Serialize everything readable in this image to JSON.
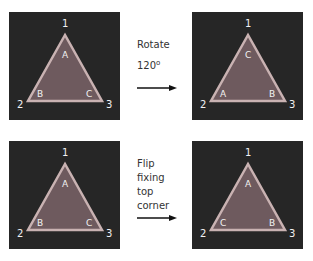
{
  "colors": {
    "panel_bg": "#262626",
    "tri_fill": "#6e5a5e",
    "tri_stroke": "#c9b2b2",
    "label": "#f2f2f2"
  },
  "vertex_labels": [
    "1",
    "2",
    "3"
  ],
  "panels": [
    {
      "id": "top-left",
      "corners": {
        "top": "A",
        "left": "B",
        "right": "C"
      }
    },
    {
      "id": "top-right",
      "corners": {
        "top": "C",
        "left": "A",
        "right": "B"
      }
    },
    {
      "id": "bottom-left",
      "corners": {
        "top": "A",
        "left": "B",
        "right": "C"
      }
    },
    {
      "id": "bottom-right",
      "corners": {
        "top": "A",
        "left": "C",
        "right": "B"
      }
    }
  ],
  "operations": [
    {
      "lines": [
        "Rotate",
        "120"
      ],
      "superscript": "o"
    },
    {
      "lines": [
        "Flip",
        "fixing",
        "top",
        "corner"
      ]
    }
  ]
}
